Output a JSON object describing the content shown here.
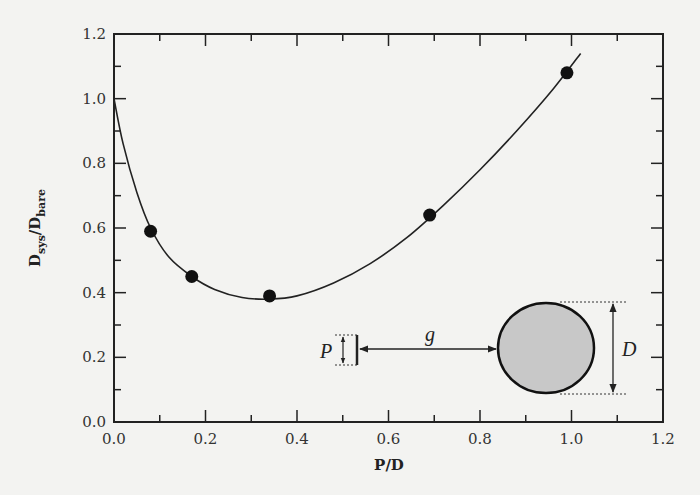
{
  "chart_data": {
    "type": "scatter",
    "title": "",
    "xlabel": "P/D",
    "ylabel": "D_sys/D_bare",
    "ylabel_main": "D",
    "ylabel_sub1": "sys",
    "ylabel_sep": "/D",
    "ylabel_sub2": "bare",
    "xlim": [
      0.0,
      1.2
    ],
    "ylim": [
      0.0,
      1.2
    ],
    "grid": false,
    "legend": "none",
    "x_ticks": [
      "0.0",
      "0.2",
      "0.4",
      "0.6",
      "0.8",
      "1.0",
      "1.2"
    ],
    "y_ticks": [
      "0.0",
      "0.2",
      "0.4",
      "0.6",
      "0.8",
      "1.0",
      "1.2"
    ],
    "series": [
      {
        "name": "measured",
        "marker": "filled-circle",
        "x": [
          0.08,
          0.17,
          0.34,
          0.69,
          0.99
        ],
        "y": [
          0.59,
          0.45,
          0.39,
          0.64,
          1.08
        ]
      },
      {
        "name": "fit curve",
        "marker": "line",
        "x": [
          0.0,
          0.02,
          0.05,
          0.08,
          0.12,
          0.17,
          0.22,
          0.28,
          0.34,
          0.4,
          0.48,
          0.56,
          0.64,
          0.72,
          0.8,
          0.88,
          0.96,
          1.02
        ],
        "y": [
          1.0,
          0.86,
          0.71,
          0.6,
          0.51,
          0.45,
          0.41,
          0.385,
          0.38,
          0.39,
          0.43,
          0.49,
          0.57,
          0.67,
          0.78,
          0.9,
          1.03,
          1.14
        ]
      }
    ],
    "inset_diagram": {
      "labels": {
        "pore": "P",
        "gap": "g",
        "diameter": "D"
      },
      "circle_fill": "#c8c8c8"
    }
  }
}
